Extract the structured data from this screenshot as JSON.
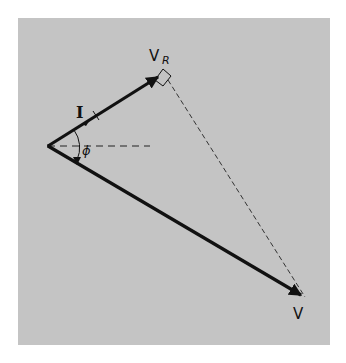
{
  "diagram": {
    "type": "phasor-diagram",
    "background_color": "#c4c4c4",
    "stroke_color": "#111111",
    "labels": {
      "current": "I",
      "resistor_voltage": "V",
      "resistor_voltage_subscript": "R",
      "total_voltage": "V",
      "phase_angle": "ϕ"
    },
    "vectors": [
      {
        "name": "I / V_R",
        "from": [
          48,
          146
        ],
        "to": [
          160,
          76
        ],
        "style": "solid-thick",
        "arrowhead": true
      },
      {
        "name": "V",
        "from": [
          48,
          146
        ],
        "to": [
          303,
          296
        ],
        "style": "solid-thick",
        "arrowhead": true
      }
    ],
    "dashed_lines": [
      {
        "name": "reference-axis",
        "from": [
          48,
          146
        ],
        "to": [
          150,
          146
        ]
      },
      {
        "name": "V_R-to-V",
        "from": [
          168,
          80
        ],
        "to": [
          305,
          297
        ]
      }
    ],
    "right_angle_marker_at": "V_R tip",
    "angle_arc": {
      "label": "ϕ",
      "between": [
        "I",
        "V"
      ]
    }
  }
}
